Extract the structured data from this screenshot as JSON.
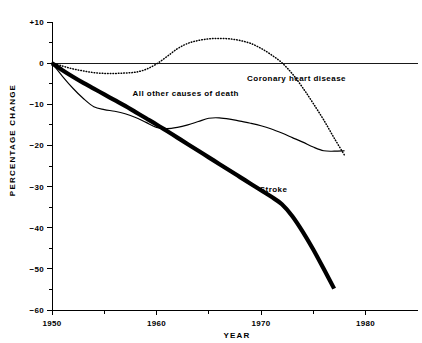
{
  "chart_data": {
    "type": "line",
    "title": "",
    "xlabel": "YEAR",
    "ylabel": "PERCENTAGE CHANGE",
    "xlim": [
      1950,
      1982
    ],
    "ylim": [
      -60,
      10
    ],
    "grid": false,
    "legend_position": "inline-annotations",
    "x_ticks_major": [
      1950,
      1960,
      1970,
      1980
    ],
    "x_ticks_minor": [
      1955,
      1965,
      1975
    ],
    "x_tick_labels": [
      "1950",
      "1960",
      "1970",
      "1980"
    ],
    "y_ticks_major": [
      10,
      0,
      -10,
      -20,
      -30,
      -40,
      -50,
      -60
    ],
    "y_ticks_minor": [
      5,
      -5,
      -15,
      -25,
      -35,
      -45,
      -55
    ],
    "y_tick_labels": [
      "+10",
      "0",
      "−10",
      "−20",
      "−30",
      "−40",
      "−50",
      "−60"
    ],
    "zero_reference_line": 0,
    "series": [
      {
        "name": "Coronary heart disease",
        "style": "dotted",
        "label": "Coronary heart disease",
        "x": [
          1950,
          1951,
          1952,
          1953,
          1954,
          1955,
          1956,
          1957,
          1958,
          1959,
          1960,
          1961,
          1962,
          1963,
          1964,
          1965,
          1966,
          1967,
          1968,
          1969,
          1970,
          1971,
          1972,
          1973,
          1974,
          1975,
          1976,
          1977,
          1978
        ],
        "values": [
          0,
          -0.7,
          -1.4,
          -1.9,
          -2.3,
          -2.5,
          -2.5,
          -2.4,
          -2.2,
          -1.5,
          -0.2,
          1.6,
          3.5,
          4.8,
          5.5,
          5.9,
          6.0,
          5.9,
          5.5,
          4.8,
          3.6,
          2.0,
          0.1,
          -2.6,
          -6.0,
          -9.8,
          -13.8,
          -18.2,
          -22.4
        ]
      },
      {
        "name": "All other causes of death",
        "style": "solid-thin",
        "label": "All other causes of death",
        "x": [
          1950,
          1951,
          1952,
          1953,
          1954,
          1955,
          1956,
          1957,
          1958,
          1959,
          1960,
          1961,
          1962,
          1963,
          1964,
          1965,
          1966,
          1967,
          1968,
          1969,
          1970,
          1971,
          1972,
          1973,
          1974,
          1975,
          1976,
          1977,
          1978
        ],
        "values": [
          0,
          -3.2,
          -6.1,
          -8.6,
          -10.6,
          -11.3,
          -11.7,
          -12.3,
          -13.2,
          -14.4,
          -15.6,
          -15.9,
          -15.6,
          -15.0,
          -14.2,
          -13.4,
          -13.3,
          -13.6,
          -14.1,
          -14.6,
          -15.2,
          -16.0,
          -17.0,
          -18.1,
          -19.2,
          -20.4,
          -21.3,
          -21.4,
          -21.3
        ]
      },
      {
        "name": "Stroke",
        "style": "solid-thick",
        "label": "Stroke",
        "x": [
          1950,
          1951,
          1952,
          1953,
          1954,
          1955,
          1956,
          1957,
          1958,
          1959,
          1960,
          1961,
          1962,
          1963,
          1964,
          1965,
          1966,
          1967,
          1968,
          1969,
          1970,
          1971,
          1972,
          1973,
          1974,
          1975,
          1976,
          1977
        ],
        "values": [
          0,
          -1.7,
          -3.3,
          -4.8,
          -6.2,
          -7.6,
          -9.0,
          -10.4,
          -11.9,
          -13.4,
          -14.9,
          -16.5,
          -18.1,
          -19.7,
          -21.3,
          -22.9,
          -24.5,
          -26.1,
          -27.7,
          -29.3,
          -30.9,
          -32.5,
          -34.3,
          -37.2,
          -41.0,
          -45.3,
          -50.0,
          -54.8
        ]
      }
    ],
    "annotations": [
      {
        "text": "Coronary heart disease",
        "x": 1973.4,
        "y": -4.3
      },
      {
        "text": "All other causes of death",
        "x": 1962.8,
        "y": -8.0
      },
      {
        "text": "Stroke",
        "x": 1971.2,
        "y": -31.3
      }
    ]
  },
  "axes": {
    "x_title": "YEAR",
    "y_title": "PERCENTAGE CHANGE"
  }
}
